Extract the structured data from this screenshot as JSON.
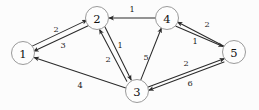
{
  "figure": {
    "background_color": "#fcfcfc",
    "edge_color": "#2b2b2b",
    "node_fill": "#fdfdfd",
    "node_stroke": "#8e8e8e",
    "label_color": "#111111"
  },
  "graph_data": {
    "type": "diagram",
    "diagram_kind": "directed-weighted-graph",
    "directed": true,
    "node_count": 5,
    "edge_count": 12,
    "nodes": [
      {
        "id": "1",
        "label": "1",
        "cx": 23,
        "cy": 53,
        "r": 11.5
      },
      {
        "id": "2",
        "label": "2",
        "cx": 97,
        "cy": 18,
        "r": 11.5
      },
      {
        "id": "3",
        "label": "3",
        "cx": 137,
        "cy": 91,
        "r": 11.5
      },
      {
        "id": "4",
        "label": "4",
        "cx": 167,
        "cy": 18,
        "r": 11.5
      },
      {
        "id": "5",
        "label": "5",
        "cx": 234,
        "cy": 52,
        "r": 11.5
      }
    ],
    "edges": [
      {
        "id": "e-1-2",
        "from": "1",
        "to": "2",
        "weight": "2",
        "lx": 56,
        "ly": 29
      },
      {
        "id": "e-2-1",
        "from": "2",
        "to": "1",
        "weight": "3",
        "lx": 63,
        "ly": 45
      },
      {
        "id": "e-4-2",
        "from": "4",
        "to": "2",
        "weight": "1",
        "lx": 132,
        "ly": 9
      },
      {
        "id": "e-2-3",
        "from": "2",
        "to": "3",
        "weight": "1",
        "lx": 120,
        "ly": 45
      },
      {
        "id": "e-3-2",
        "from": "3",
        "to": "2",
        "weight": "2",
        "lx": 108,
        "ly": 59
      },
      {
        "id": "e-3-4",
        "from": "3",
        "to": "4",
        "weight": "5",
        "lx": 146,
        "ly": 57
      },
      {
        "id": "e-5-4",
        "from": "5",
        "to": "4",
        "weight": "2",
        "lx": 207,
        "ly": 24
      },
      {
        "id": "e-4-5",
        "from": "4",
        "to": "5",
        "weight": "1",
        "lx": 195,
        "ly": 41
      },
      {
        "id": "e-3-5",
        "from": "3",
        "to": "5",
        "weight": "2",
        "lx": 186,
        "ly": 63
      },
      {
        "id": "e-5-3",
        "from": "5",
        "to": "3",
        "weight": "6",
        "lx": 190,
        "ly": 83
      },
      {
        "id": "e-3-1",
        "from": "3",
        "to": "1",
        "weight": "4",
        "lx": 80,
        "ly": 85
      }
    ]
  }
}
